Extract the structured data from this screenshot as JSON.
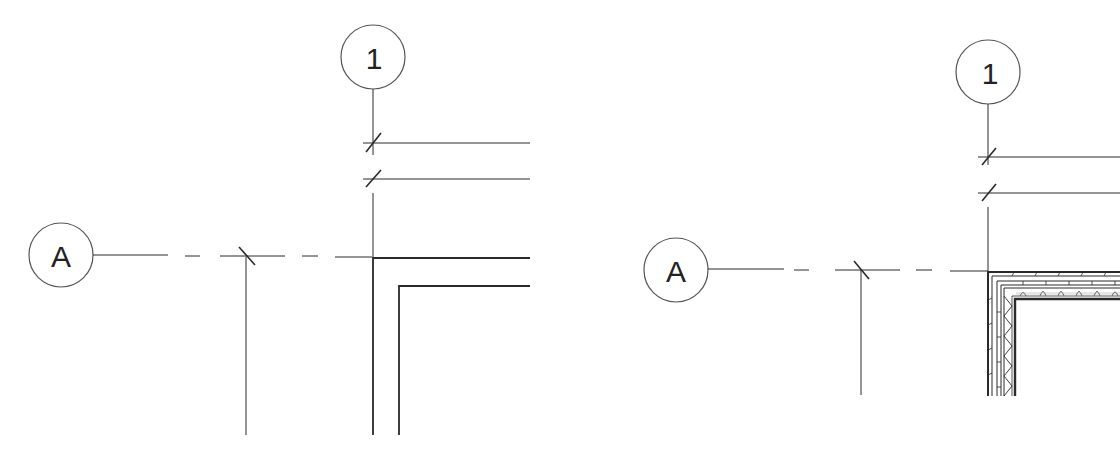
{
  "panels": [
    {
      "name": "left-plan-simple-walls",
      "grid_bubbles": {
        "vertical_label": "1",
        "horizontal_label": "A"
      },
      "wall_style": "double-line"
    },
    {
      "name": "right-plan-detailed-walls",
      "grid_bubbles": {
        "vertical_label": "1",
        "horizontal_label": "A"
      },
      "wall_style": "layered-with-insulation-hatch"
    }
  ],
  "colors": {
    "line": "#2a2a2a",
    "background": "#ffffff",
    "bubble_stroke": "#555555"
  }
}
